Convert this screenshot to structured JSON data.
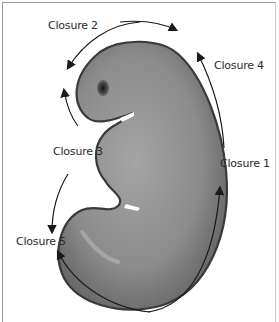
{
  "figure": {
    "labels": {
      "closure1": "Closure 1",
      "closure2": "Closure 2",
      "closure3": "Closure 3",
      "closure4": "Closure 4",
      "closure5": "Closure 5"
    },
    "colors": {
      "embryo_fill": "#8a8a8a",
      "embryo_outline": "#3a3a3a",
      "arrow": "#1a1a1a",
      "frame_border": "#9a9a9a",
      "background": "#ffffff"
    }
  }
}
